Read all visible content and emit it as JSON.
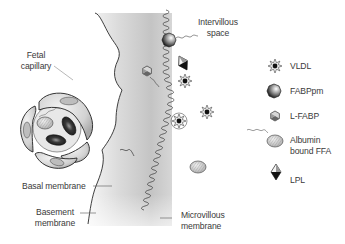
{
  "diagram": {
    "type": "placental-fatty-acid-transport-schematic",
    "regions": {
      "fetal_capillary": "Fetal capillary",
      "intervillous_space": "Intervillous space"
    },
    "labels": {
      "fetal_capillary_line1": "Fetal",
      "fetal_capillary_line2": "capillary",
      "intervillous_line1": "Intervillous",
      "intervillous_line2": "space",
      "basal_membrane": "Basal membrane",
      "basement_line1": "Basement",
      "basement_line2": "membrane",
      "microvillous_line1": "Microvillous",
      "microvillous_line2": "membrane"
    },
    "legend": [
      {
        "icon": "vldl-star-icon",
        "label": "VLDL"
      },
      {
        "icon": "fabppm-sphere-icon",
        "label": "FABPpm"
      },
      {
        "icon": "l-fabp-hexagon-icon",
        "label": "L-FABP"
      },
      {
        "icon": "albumin-ffa-icon",
        "label_line1": "Albumin",
        "label_line2": "bound FFA"
      },
      {
        "icon": "lpl-diamond-icon",
        "label": "LPL"
      }
    ],
    "colors": {
      "outline": "#333333",
      "text": "#3a3a3a",
      "tissue_dark": "#b8b8b8",
      "tissue_light": "#f2f2f2",
      "rbc": "#2e2e2e"
    }
  }
}
